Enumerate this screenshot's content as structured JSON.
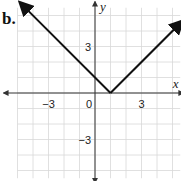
{
  "problem_label": "b.",
  "chart_data": {
    "type": "line",
    "title": "",
    "function": "y = |x - 1|",
    "xlabel": "x",
    "ylabel": "y",
    "xlim": [
      -5.5,
      5.5
    ],
    "ylim": [
      -6,
      5.5
    ],
    "grid": true,
    "x_ticks": [
      {
        "value": -3,
        "label": "-3"
      },
      {
        "value": 0,
        "label": "0"
      },
      {
        "value": 3,
        "label": "3"
      }
    ],
    "y_ticks": [
      {
        "value": 3,
        "label": "3"
      },
      {
        "value": -3,
        "label": "-3"
      }
    ],
    "series": [
      {
        "name": "graph",
        "points": [
          [
            -5,
            6
          ],
          [
            1,
            0
          ],
          [
            5.5,
            4.5
          ]
        ],
        "arrows_at_ends": true
      }
    ],
    "vertex": [
      1,
      0
    ],
    "y_intercept": 1
  },
  "colors": {
    "grid": "#d8d8d8",
    "axis": "#333333",
    "line": "#111111"
  }
}
